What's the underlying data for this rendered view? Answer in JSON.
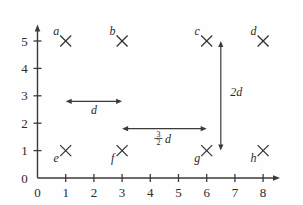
{
  "chart_data": {
    "type": "scatter",
    "title": "",
    "subtitle": "",
    "xlabel": "",
    "ylabel": "",
    "xlim": [
      0,
      8.6
    ],
    "ylim": [
      0,
      5.6
    ],
    "grid": false,
    "legend": "none",
    "x_ticks": [
      "0",
      "1",
      "2",
      "3",
      "4",
      "5",
      "6",
      "7",
      "8"
    ],
    "x_tick_values": [
      0,
      1,
      2,
      3,
      4,
      5,
      6,
      7,
      8
    ],
    "y_ticks": [
      "0",
      "1",
      "2",
      "3",
      "4",
      "5"
    ],
    "y_tick_values": [
      0,
      1,
      2,
      3,
      4,
      5
    ],
    "marker_style": "x",
    "marker_color": "#333333",
    "axis_color": "#3a3a3a",
    "points": [
      {
        "label": "a",
        "x": 1,
        "y": 5,
        "label_pos": "upper-left"
      },
      {
        "label": "b",
        "x": 3,
        "y": 5,
        "label_pos": "upper-left"
      },
      {
        "label": "c",
        "x": 6,
        "y": 5,
        "label_pos": "upper-left"
      },
      {
        "label": "d",
        "x": 8,
        "y": 5,
        "label_pos": "upper-left"
      },
      {
        "label": "e",
        "x": 1,
        "y": 1,
        "label_pos": "lower-left"
      },
      {
        "label": "f",
        "x": 3,
        "y": 1,
        "label_pos": "lower-left"
      },
      {
        "label": "g",
        "x": 6,
        "y": 1,
        "label_pos": "lower-left"
      },
      {
        "label": "h",
        "x": 8,
        "y": 1,
        "label_pos": "lower-left"
      }
    ],
    "annotations": [
      {
        "name": "distance-d",
        "text": "d",
        "kind": "double-arrow-horizontal",
        "x_start": 1,
        "x_end": 3,
        "y": 2.8,
        "label_x": 2,
        "label_y": 2.35
      },
      {
        "name": "distance-three-halves-d",
        "text": "3/2 d",
        "numerator": "3",
        "denominator": "2",
        "variable": "d",
        "kind": "double-arrow-horizontal",
        "x_start": 3,
        "x_end": 6,
        "y": 1.8,
        "label_x": 4.5,
        "label_y": 1.35
      },
      {
        "name": "distance-2d",
        "text": "2d",
        "kind": "double-arrow-vertical",
        "x": 6.5,
        "y_start": 1,
        "y_end": 5,
        "label_x": 7.05,
        "label_y": 3.0
      }
    ]
  }
}
